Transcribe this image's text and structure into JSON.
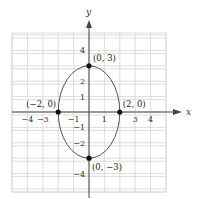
{
  "chart_data": {
    "type": "line",
    "title": "",
    "xlabel": "x",
    "ylabel": "y",
    "xlim": [
      -5,
      5
    ],
    "ylim": [
      -5,
      5
    ],
    "grid": true,
    "x_ticks": [
      -4,
      -3,
      -1,
      1,
      3,
      4
    ],
    "y_ticks": [
      4,
      2,
      1,
      -1,
      -2,
      -4
    ],
    "x_tick_labels": [
      "−4",
      "−3",
      "−1",
      "1",
      "3",
      "4"
    ],
    "y_tick_labels": [
      "4",
      "2",
      "1",
      "−1",
      "−2",
      "−4"
    ],
    "series": [
      {
        "name": "ellipse x^2/4 + y^2/9 = 1",
        "shape": "ellipse",
        "center": [
          0,
          0
        ],
        "semi_axis_x": 2,
        "semi_axis_y": 3
      }
    ],
    "points": [
      {
        "x": 0,
        "y": 3,
        "label": "(0, 3)"
      },
      {
        "x": 2,
        "y": 0,
        "label": "(2, 0)"
      },
      {
        "x": -2,
        "y": 0,
        "label": "(−2, 0)"
      },
      {
        "x": 0,
        "y": -3,
        "label": "(0, −3)"
      }
    ]
  },
  "colors": {
    "grid": "#d4d4d4",
    "axis": "#444444",
    "curve": "#555555",
    "point": "#111111"
  }
}
